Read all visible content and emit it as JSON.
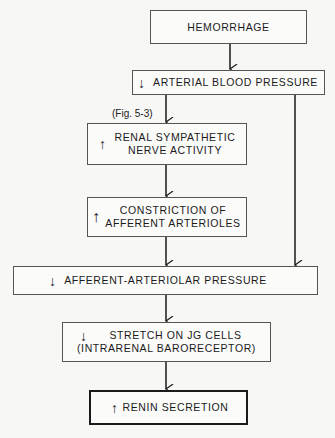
{
  "diagram": {
    "nodes": [
      {
        "id": "hemorrhage",
        "label": "HEMORRHAGE",
        "arrow": ""
      },
      {
        "id": "arterial_bp",
        "label": "ARTERIAL BLOOD PRESSURE",
        "arrow": "↓"
      },
      {
        "id": "renal_sympathetic",
        "label_line1": "RENAL SYMPATHETIC",
        "label_line2": "NERVE ACTIVITY",
        "arrow": "↑"
      },
      {
        "id": "constriction",
        "label_line1": "CONSTRICTION OF",
        "label_line2": "AFFERENT ARTERIOLES",
        "arrow": "↑"
      },
      {
        "id": "afferent_pressure",
        "label": "AFFERENT-ARTERIOLAR PRESSURE",
        "arrow": "↓"
      },
      {
        "id": "stretch_jg",
        "label_line1": "STRETCH ON JG CELLS",
        "label_line2": "(INTRARENAL BARORECEPTOR)",
        "arrow": "↓"
      },
      {
        "id": "renin",
        "label": "RENIN SECRETION",
        "arrow": "↑"
      }
    ],
    "annotation": "(Fig. 5-3)",
    "edges": [
      [
        "hemorrhage",
        "arterial_bp"
      ],
      [
        "arterial_bp",
        "renal_sympathetic"
      ],
      [
        "renal_sympathetic",
        "constriction"
      ],
      [
        "constriction",
        "afferent_pressure"
      ],
      [
        "arterial_bp",
        "afferent_pressure"
      ],
      [
        "afferent_pressure",
        "stretch_jg"
      ],
      [
        "stretch_jg",
        "renin"
      ]
    ]
  }
}
